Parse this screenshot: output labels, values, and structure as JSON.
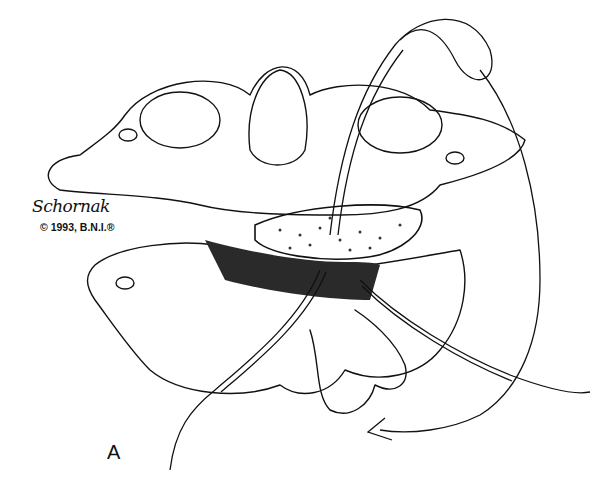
{
  "illustration": {
    "subject": "cervical vertebrae with bone graft and wire fixation",
    "signature": "Schornak",
    "copyright": "© 1993, B.N.I.®",
    "panel_label": "A",
    "colors": {
      "ink": "#111111",
      "paper": "#ffffff",
      "shade": "#2a2a2a"
    }
  }
}
